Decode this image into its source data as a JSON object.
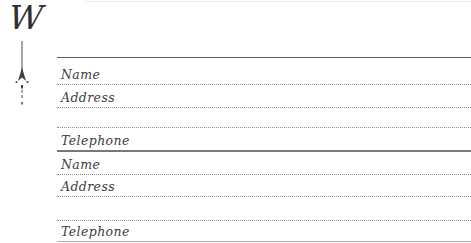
{
  "page": {
    "letter_tab": "W",
    "background_color": "#ffffff",
    "rule_line_color": "#5e5e5e",
    "dotted_line_color": "#8d8d8d",
    "label_color": "#3d3d3d"
  },
  "icons": {
    "ornament": "arrow-divider-ornament"
  },
  "form": {
    "records": [
      {
        "rows": [
          {
            "label": "Name"
          },
          {
            "label": "Address"
          },
          {
            "label": ""
          },
          {
            "label": "Telephone"
          }
        ]
      },
      {
        "rows": [
          {
            "label": "Name"
          },
          {
            "label": "Address"
          },
          {
            "label": ""
          },
          {
            "label": "Telephone"
          }
        ]
      }
    ]
  }
}
